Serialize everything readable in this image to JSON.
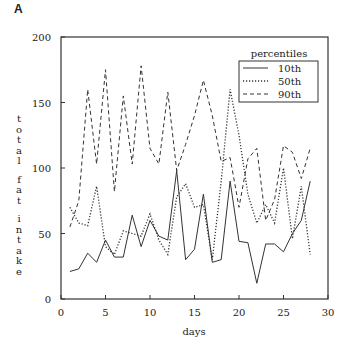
{
  "panel_label": "A",
  "chart_data": {
    "type": "line",
    "title": "",
    "xlabel": "days",
    "ylabel": "total fat intake",
    "xlim": [
      0,
      30
    ],
    "ylim": [
      0,
      200
    ],
    "xticks": [
      0,
      5,
      10,
      15,
      20,
      25,
      30
    ],
    "yticks": [
      0,
      50,
      100,
      150,
      200
    ],
    "grid": false,
    "legend": {
      "title": "percentiles",
      "position": "upper right"
    },
    "x": [
      1,
      2,
      3,
      4,
      5,
      6,
      7,
      8,
      9,
      10,
      11,
      12,
      13,
      14,
      15,
      16,
      17,
      18,
      19,
      20,
      21,
      22,
      23,
      24,
      25,
      26,
      27,
      28
    ],
    "series": [
      {
        "name": "10th",
        "style": "solid",
        "values": [
          21,
          23,
          35,
          28,
          45,
          32,
          32,
          64,
          40,
          60,
          48,
          45,
          98,
          30,
          38,
          80,
          28,
          30,
          90,
          44,
          43,
          12,
          42,
          42,
          36,
          50,
          60,
          90
        ]
      },
      {
        "name": "50th",
        "style": "dotted",
        "values": [
          70,
          58,
          56,
          86,
          40,
          34,
          52,
          50,
          48,
          65,
          45,
          34,
          78,
          88,
          70,
          72,
          30,
          90,
          160,
          125,
          80,
          58,
          72,
          58,
          100,
          46,
          86,
          34
        ]
      },
      {
        "name": "90th",
        "style": "dashed",
        "values": [
          55,
          75,
          160,
          103,
          175,
          82,
          155,
          103,
          178,
          115,
          103,
          158,
          98,
          118,
          140,
          167,
          140,
          105,
          108,
          70,
          107,
          115,
          60,
          76,
          117,
          112,
          92,
          115
        ]
      }
    ]
  }
}
